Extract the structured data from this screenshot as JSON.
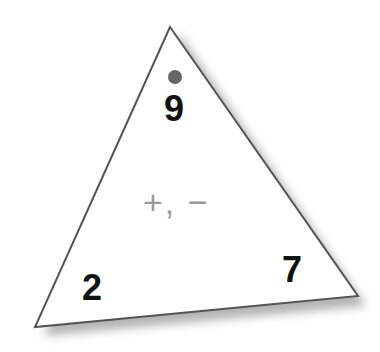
{
  "triangle": {
    "top_number": "9",
    "bottom_left_number": "2",
    "bottom_right_number": "7",
    "operations": "+, −",
    "dot_color": "#666666",
    "edge_color": "#555555"
  }
}
